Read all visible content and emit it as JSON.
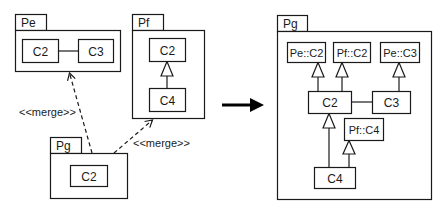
{
  "diagram": {
    "type": "UML package merge",
    "before": {
      "packages": [
        {
          "name": "Pe",
          "classes": [
            "C2",
            "C3"
          ],
          "relations": [
            {
              "from": "C2",
              "to": "C3",
              "kind": "association"
            }
          ]
        },
        {
          "name": "Pf",
          "classes": [
            "C2",
            "C4"
          ],
          "relations": [
            {
              "from": "C4",
              "to": "C2",
              "kind": "generalization"
            }
          ]
        },
        {
          "name": "Pg",
          "classes": [
            "C2"
          ],
          "relations": []
        }
      ],
      "merges": [
        {
          "from": "Pg",
          "to": "Pe",
          "label": "<<merge>>"
        },
        {
          "from": "Pg",
          "to": "Pf",
          "label": "<<merge>>"
        }
      ]
    },
    "after": {
      "package": "Pg",
      "classes": [
        "Pe::C2",
        "Pf::C2",
        "Pe::C3",
        "C2",
        "C3",
        "Pf::C4",
        "C4"
      ],
      "relations": [
        {
          "from": "C2",
          "to": "Pe::C2",
          "kind": "generalization"
        },
        {
          "from": "C2",
          "to": "Pf::C2",
          "kind": "generalization"
        },
        {
          "from": "C3",
          "to": "Pe::C3",
          "kind": "generalization"
        },
        {
          "from": "C2",
          "to": "C3",
          "kind": "association"
        },
        {
          "from": "C4",
          "to": "C2",
          "kind": "generalization"
        },
        {
          "from": "C4",
          "to": "Pf::C4",
          "kind": "generalization"
        }
      ]
    }
  },
  "labels": {
    "pe": "Pe",
    "pf": "Pf",
    "pg_left": "Pg",
    "pg_right": "Pg",
    "pe_c2": "C2",
    "pe_c3": "C3",
    "pf_c2": "C2",
    "pf_c4": "C4",
    "pg_c2": "C2",
    "merge1": "<<merge>>",
    "merge2": "<<merge>>",
    "r_pe_c2": "Pe::C2",
    "r_pf_c2": "Pf::C2",
    "r_pe_c3": "Pe::C3",
    "r_c2": "C2",
    "r_c3": "C3",
    "r_pf_c4": "Pf::C4",
    "r_c4": "C4"
  },
  "colors": {
    "stroke": "#1a1a1a",
    "background": "#ffffff"
  }
}
